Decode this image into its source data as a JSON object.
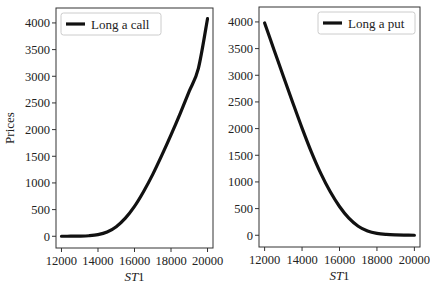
{
  "chart_data": [
    {
      "type": "line",
      "title": "",
      "xlabel": "ST1",
      "ylabel": "Prices",
      "xlim": [
        11700,
        20300
      ],
      "ylim": [
        -220,
        4280
      ],
      "xticks": [
        12000,
        14000,
        16000,
        18000,
        20000
      ],
      "yticks": [
        0,
        500,
        1000,
        1500,
        2000,
        2500,
        3000,
        3500,
        4000
      ],
      "xtick_labels": [
        "12000",
        "14000",
        "16000",
        "18000",
        "20000"
      ],
      "ytick_labels": [
        "0",
        "500",
        "1000",
        "1500",
        "2000",
        "2500",
        "3000",
        "3500",
        "4000"
      ],
      "grid": false,
      "legend_position": "upper left",
      "series": [
        {
          "name": "Long a call",
          "color": "#111111",
          "x": [
            12000,
            12500,
            13000,
            13500,
            14000,
            14500,
            15000,
            15500,
            16000,
            16500,
            17000,
            17500,
            18000,
            18500,
            19000,
            19500,
            20000
          ],
          "values": [
            0,
            1,
            3,
            10,
            30,
            80,
            180,
            340,
            560,
            840,
            1160,
            1520,
            1900,
            2300,
            2720,
            3150,
            4080
          ]
        }
      ]
    },
    {
      "type": "line",
      "title": "",
      "xlabel": "ST1",
      "ylabel": "",
      "xlim": [
        11700,
        20300
      ],
      "ylim": [
        -220,
        4280
      ],
      "xticks": [
        12000,
        14000,
        16000,
        18000,
        20000
      ],
      "yticks": [
        0,
        500,
        1000,
        1500,
        2000,
        2500,
        3000,
        3500,
        4000
      ],
      "xtick_labels": [
        "12000",
        "14000",
        "16000",
        "18000",
        "20000"
      ],
      "ytick_labels": [
        "0",
        "500",
        "1000",
        "1500",
        "2000",
        "2500",
        "3000",
        "3500",
        "4000"
      ],
      "grid": false,
      "legend_position": "upper right",
      "series": [
        {
          "name": "Long a put",
          "color": "#111111",
          "x": [
            12000,
            12500,
            13000,
            13500,
            14000,
            14500,
            15000,
            15500,
            16000,
            16500,
            17000,
            17500,
            18000,
            18500,
            19000,
            19500,
            20000
          ],
          "values": [
            3980,
            3480,
            2980,
            2490,
            2010,
            1560,
            1160,
            820,
            540,
            320,
            170,
            80,
            35,
            15,
            6,
            2,
            0
          ]
        }
      ]
    }
  ],
  "panels": [
    {
      "legend": "Long a call",
      "xlabel_main": "ST",
      "xlabel_sub": "1",
      "ylabel": "Prices"
    },
    {
      "legend": "Long a put",
      "xlabel_main": "ST",
      "xlabel_sub": "1",
      "ylabel": ""
    }
  ]
}
